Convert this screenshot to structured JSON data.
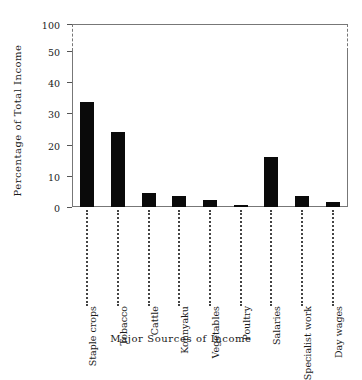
{
  "chart_data": {
    "type": "bar",
    "title": "",
    "xlabel": "Major Sources of Income",
    "ylabel": "Percentage of Total Income",
    "categories": [
      "Staple crops",
      "Tobacco",
      "Cattle",
      "Konnyaku",
      "Vegetables",
      "Poultry",
      "Salaries",
      "Specialist work",
      "Day wages"
    ],
    "values": [
      33.5,
      24.0,
      4.5,
      3.5,
      2.3,
      0.6,
      16.0,
      3.5,
      1.5
    ],
    "yticks": [
      0,
      10,
      20,
      30,
      40,
      50,
      100
    ],
    "ytick_labels": [
      "0",
      "10",
      "20",
      "30",
      "40",
      "50",
      "100"
    ],
    "ylim": [
      0,
      100
    ],
    "axis_break": {
      "between": [
        50,
        100
      ],
      "style": "dashed"
    },
    "grid": false,
    "legend": null,
    "bar_color": "#0a0a0a",
    "axis_color": "#777777",
    "category_label_leader": "dotted"
  }
}
